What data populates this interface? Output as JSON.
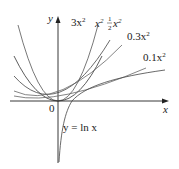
{
  "figure": {
    "title": "",
    "axes": {
      "x_label": "x",
      "y_label": "y",
      "origin_label": "0"
    },
    "curves": [
      {
        "name": "3x^2",
        "label": "3x",
        "exp": "2",
        "coef": 3
      },
      {
        "name": "x^2",
        "label": "x",
        "exp": "2",
        "coef": 1
      },
      {
        "name": "1/2 x^2",
        "label_num": "1",
        "label_den": "2",
        "label": "x",
        "exp": "2",
        "coef": 0.5
      },
      {
        "name": "0.3x^2",
        "label": "0.3x",
        "exp": "2",
        "coef": 0.3
      },
      {
        "name": "0.1x^2",
        "label": "0.1x",
        "exp": "2",
        "coef": 0.1
      }
    ],
    "log_curve_label": "y = ln x"
  }
}
